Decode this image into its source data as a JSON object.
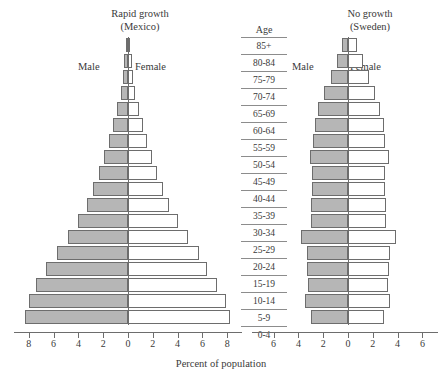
{
  "figure": {
    "xlabel": "Percent of population",
    "age_header": "Age",
    "male_label": "Male",
    "female_label": "Female",
    "bar_fill_male": "#b6b6b6",
    "bar_fill_female": "#ffffff",
    "bar_stroke": "#6d6d6d"
  },
  "chart_data": {
    "type": "bar",
    "subtype": "population-pyramid",
    "xlabel": "Percent of population",
    "ylabel": "Age",
    "grid": false,
    "legend_position": "inside-top",
    "categories": [
      "85+",
      "80-84",
      "75-79",
      "70-74",
      "65-69",
      "60-64",
      "55-59",
      "50-54",
      "45-49",
      "40-44",
      "35-39",
      "30-34",
      "25-29",
      "20-24",
      "15-19",
      "10-14",
      "5-9",
      "0-4"
    ],
    "panels": [
      {
        "name": "mexico",
        "title_line1": "Rapid growth",
        "title_line2": "(Mexico)",
        "xlim": [
          -8.6,
          8.6
        ],
        "ticks": [
          8,
          6,
          4,
          2,
          0,
          2,
          4,
          6,
          8
        ],
        "series": [
          {
            "name": "Male",
            "side": "left",
            "values": [
              0.2,
              0.3,
              0.4,
              0.6,
              0.9,
              1.2,
              1.5,
              1.9,
              2.3,
              2.8,
              3.3,
              4.0,
              4.8,
              5.7,
              6.6,
              7.4,
              8.0,
              8.3
            ]
          },
          {
            "name": "Female",
            "side": "right",
            "values": [
              0.2,
              0.3,
              0.4,
              0.6,
              0.9,
              1.2,
              1.5,
              1.9,
              2.3,
              2.8,
              3.3,
              4.0,
              4.8,
              5.7,
              6.4,
              7.2,
              7.9,
              8.2
            ]
          }
        ]
      },
      {
        "name": "sweden",
        "title_line1": "No growth",
        "title_line2": "(Sweden)",
        "xlim": [
          -4.6,
          6.6
        ],
        "ticks": [
          6,
          4,
          2,
          0,
          2,
          4,
          6
        ],
        "series": [
          {
            "name": "Male",
            "side": "left",
            "values": [
              0.5,
              0.9,
              1.4,
              1.9,
              2.4,
              2.7,
              2.8,
              3.1,
              2.9,
              2.9,
              3.0,
              3.0,
              3.8,
              3.3,
              3.3,
              3.2,
              3.5,
              3.0
            ]
          },
          {
            "name": "Female",
            "side": "right",
            "values": [
              0.7,
              1.2,
              1.7,
              2.2,
              2.6,
              2.9,
              3.0,
              3.3,
              3.0,
              3.0,
              3.1,
              3.1,
              3.9,
              3.4,
              3.3,
              3.2,
              3.4,
              2.9
            ]
          }
        ]
      }
    ]
  }
}
